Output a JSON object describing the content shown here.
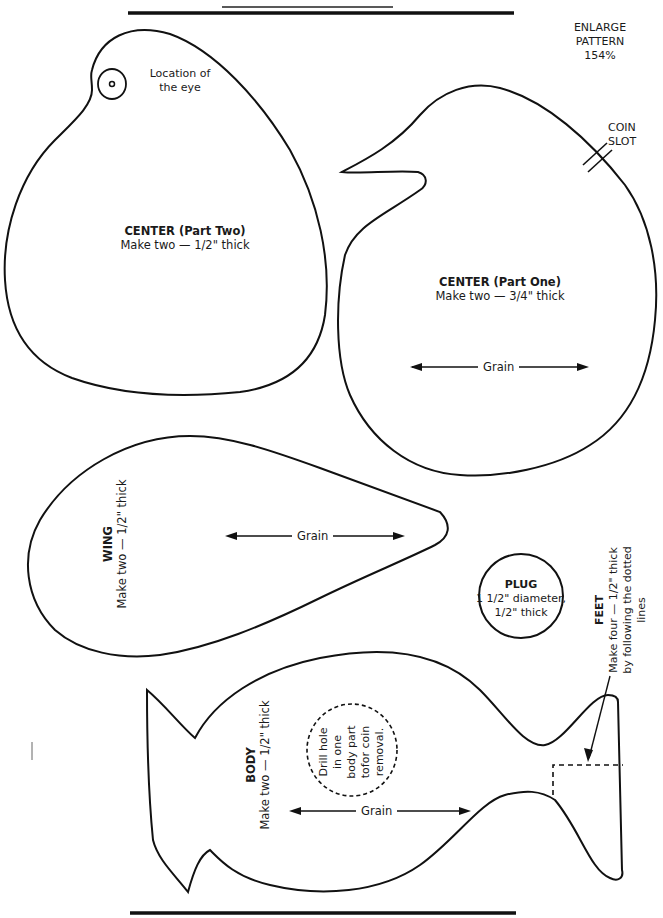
{
  "header": {
    "enlarge_line1": "ENLARGE",
    "enlarge_line2": "PATTERN",
    "enlarge_percent": "154%"
  },
  "pieces": {
    "center_two": {
      "title": "CENTER (Part Two)",
      "instruction": "Make two — 1/2\" thick",
      "eye_label_line1": "Location of",
      "eye_label_line2": "the eye"
    },
    "center_one": {
      "title": "CENTER (Part One)",
      "instruction": "Make two — 3/4\" thick",
      "grain": "Grain",
      "coin_slot_line1": "COIN",
      "coin_slot_line2": "SLOT"
    },
    "wing": {
      "title": "WING",
      "instruction": "Make two — 1/2\" thick",
      "grain": "Grain"
    },
    "plug": {
      "title": "PLUG",
      "line1": "1 1/2\" diameter,",
      "line2": "1/2\" thick"
    },
    "feet": {
      "title": "FEET",
      "line1": "Make four — 1/2\" thick",
      "line2": "by following the dotted",
      "line3": "lines"
    },
    "body": {
      "title": "BODY",
      "instruction": "Make two — 1/2\" thick",
      "grain": "Grain",
      "drill_line1": "Drill hole",
      "drill_line2": "in one",
      "drill_line3": "body part",
      "drill_line4": "tofor coin",
      "drill_line5": "removal."
    }
  },
  "colors": {
    "ink": "#1a1a1a",
    "paper": "#ffffff"
  }
}
